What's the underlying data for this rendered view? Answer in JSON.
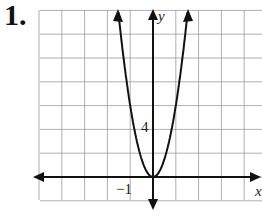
{
  "problem": {
    "number": "1."
  },
  "chart_data": {
    "type": "line",
    "title": "",
    "xlabel": "x",
    "ylabel": "y",
    "equation_estimate": "y = 6x^2",
    "x_tick_labels": [
      {
        "value": -1,
        "label": "−1"
      }
    ],
    "y_tick_labels": [
      {
        "value": 4,
        "label": "4"
      }
    ],
    "x_unit_per_grid": 1,
    "y_unit_per_grid": 2,
    "xlim": [
      -5,
      4.7
    ],
    "ylim": [
      -1,
      14
    ],
    "grid": true,
    "series": [
      {
        "name": "parabola",
        "x": [
          -1.5,
          -1,
          -0.5,
          0,
          0.5,
          1,
          1.5
        ],
        "y": [
          14,
          6,
          1.5,
          0,
          1.5,
          6,
          14
        ]
      }
    ],
    "vertex": [
      0,
      0
    ]
  },
  "labels": {
    "y_axis": "y",
    "x_axis": "x",
    "tick_y": "4",
    "tick_x": "−1"
  },
  "colors": {
    "grid": "#9a9a9a",
    "axis": "#111111",
    "curve": "#111111"
  }
}
